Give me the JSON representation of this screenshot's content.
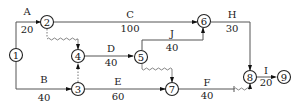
{
  "diagram": {
    "type": "time-scaled activity network",
    "nodes": [
      {
        "id": "1",
        "label": "1"
      },
      {
        "id": "2",
        "label": "2"
      },
      {
        "id": "3",
        "label": "3"
      },
      {
        "id": "4",
        "label": "4"
      },
      {
        "id": "5",
        "label": "5"
      },
      {
        "id": "6",
        "label": "6"
      },
      {
        "id": "7",
        "label": "7"
      },
      {
        "id": "8",
        "label": "8"
      },
      {
        "id": "9",
        "label": "9"
      }
    ],
    "activities": [
      {
        "name": "A",
        "duration": "20",
        "from": "1",
        "to": "2"
      },
      {
        "name": "B",
        "duration": "40",
        "from": "1",
        "to": "3"
      },
      {
        "name": "C",
        "duration": "100",
        "from": "2",
        "to": "6"
      },
      {
        "name": "D",
        "duration": "40",
        "from": "4",
        "to": "5"
      },
      {
        "name": "E",
        "duration": "60",
        "from": "3",
        "to": "7"
      },
      {
        "name": "J",
        "duration": "40",
        "from": "5",
        "to": "6"
      },
      {
        "name": "F",
        "duration": "40",
        "from": "7",
        "to": "8"
      },
      {
        "name": "H",
        "duration": "30",
        "from": "6",
        "to": "8"
      },
      {
        "name": "I",
        "duration": "20",
        "from": "8",
        "to": "9"
      }
    ],
    "dummies": [
      {
        "from": "2",
        "to": "4",
        "style": "wavy"
      },
      {
        "from": "3",
        "to": "4",
        "style": "dashed"
      },
      {
        "from": "5",
        "to": "7",
        "style": "wavy"
      }
    ]
  }
}
